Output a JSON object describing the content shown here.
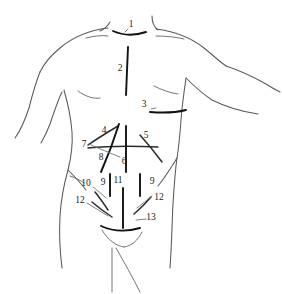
{
  "figure": {
    "style": "line drawing",
    "colors": {
      "background": "#ffffff",
      "body_outline": "#5a5a5a",
      "body_detail": "#6e6e6e",
      "incision_line": "#111111",
      "leader_line": "#6a6a6a",
      "label_text": "#1a1a1a"
    }
  },
  "labels": [
    {
      "id": "1",
      "text": "1",
      "x": 131,
      "y": 25,
      "region": "neck-collar"
    },
    {
      "id": "2",
      "text": "2",
      "x": 120,
      "y": 69,
      "region": "median-sternotomy"
    },
    {
      "id": "3",
      "text": "3",
      "x": 144,
      "y": 105,
      "region": "subcostal-right"
    },
    {
      "id": "4",
      "text": "4",
      "x": 104,
      "y": 131,
      "region": "oblique-upper-left"
    },
    {
      "id": "5",
      "text": "5",
      "x": 146,
      "y": 136,
      "region": "oblique-upper-right"
    },
    {
      "id": "6",
      "text": "6",
      "x": 124,
      "y": 162,
      "region": "upper-midline"
    },
    {
      "id": "7",
      "text": "7",
      "x": 84,
      "y": 145,
      "region": "transverse"
    },
    {
      "id": "8",
      "text": "8",
      "x": 101,
      "y": 158,
      "region": "paramedian-left"
    },
    {
      "id": "9",
      "text": "9",
      "x": 103,
      "y": 183,
      "region": "pararectal-left"
    },
    {
      "id": "10",
      "text": "10",
      "x": 86,
      "y": 184,
      "region": "flank-left"
    },
    {
      "id": "11",
      "text": "11",
      "x": 118,
      "y": 181,
      "region": "lower-midline"
    },
    {
      "id": "12",
      "text": "12",
      "x": 80,
      "y": 201,
      "region": "inguinal-left"
    },
    {
      "id": "9b",
      "text": "9",
      "x": 152,
      "y": 182,
      "region": "pararectal-right"
    },
    {
      "id": "12b",
      "text": "12",
      "x": 159,
      "y": 198,
      "region": "inguinal-right"
    },
    {
      "id": "13",
      "text": "13",
      "x": 151,
      "y": 218,
      "region": "pfannenstiel"
    }
  ]
}
